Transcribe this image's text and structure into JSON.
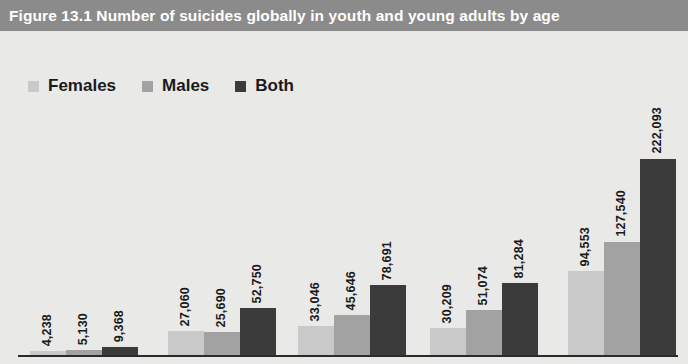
{
  "header": {
    "title": "Figure 13.1  Number of suicides globally in youth and young adults by age"
  },
  "watermark": {
    "line1": "",
    "line2": ""
  },
  "colors": {
    "header_band": "#8b8b8b",
    "plot_background": "#e9e9e7",
    "axis": "#2b2b2b",
    "females": "#c9c9c9",
    "males": "#a2a2a2",
    "both": "#3b3b3b",
    "label_text": "#1a1a1a",
    "title_text": "#ffffff"
  },
  "legend": {
    "position": "top-left",
    "items": [
      {
        "label": "Females",
        "color": "#c9c9c9"
      },
      {
        "label": "Males",
        "color": "#a2a2a2"
      },
      {
        "label": "Both",
        "color": "#3b3b3b"
      }
    ]
  },
  "chart_data": {
    "type": "bar",
    "title": "Figure 13.1  Number of suicides globally in youth and young adults by age",
    "xlabel": "",
    "ylabel": "",
    "grid": false,
    "legend_position": "top-left",
    "ylim": [
      0,
      240000
    ],
    "categories": [
      "Group 1",
      "Group 2",
      "Group 3",
      "Group 4",
      "Group 5"
    ],
    "series": [
      {
        "name": "Females",
        "color": "#c9c9c9",
        "values": [
          4238,
          27060,
          33046,
          30209,
          94553
        ],
        "labels": [
          "4,238",
          "27,060",
          "33,046",
          "30,209",
          "94,553"
        ]
      },
      {
        "name": "Males",
        "color": "#a2a2a2",
        "values": [
          5130,
          25690,
          45646,
          51074,
          127540
        ],
        "labels": [
          "5,130",
          "25,690",
          "45,646",
          "51,074",
          "127,540"
        ]
      },
      {
        "name": "Both",
        "color": "#3b3b3b",
        "values": [
          9368,
          52750,
          78691,
          81284,
          222093
        ],
        "labels": [
          "9,368",
          "52,750",
          "78,691",
          "81,284",
          "222,093"
        ]
      }
    ]
  },
  "layout": {
    "group_left_positions": [
      30,
      168,
      298,
      430,
      568
    ],
    "bar_width": 36,
    "baseline_y": 324,
    "max_bar_height": 212
  }
}
